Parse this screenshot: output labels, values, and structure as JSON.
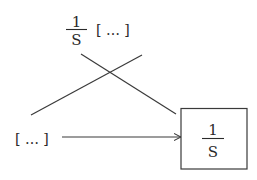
{
  "diagram": {
    "top_label": {
      "numerator": "1",
      "denominator": "S",
      "bracket_text": "[ … ]"
    },
    "left_label": {
      "bracket_text": "[ … ]"
    },
    "block": {
      "numerator": "1",
      "denominator": "S"
    },
    "connections": [
      {
        "from": "left_label",
        "to": "block",
        "type": "arrow"
      },
      {
        "from": "top_label",
        "to": "block",
        "type": "line"
      },
      {
        "from": "left_label",
        "to": "top-right",
        "type": "line"
      }
    ]
  }
}
